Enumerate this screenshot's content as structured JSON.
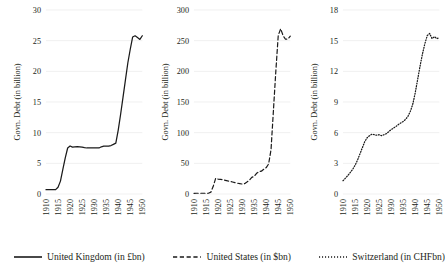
{
  "chart_data": {
    "type": "line",
    "title": "",
    "layout": "three side-by-side panels, shared x axis years 1910-1950",
    "grid": true,
    "legend_position": "bottom",
    "panels": [
      {
        "id": "united-kingdom",
        "series_name": "United Kingdom (in £bn)",
        "line_style": "solid",
        "ylabel": "Govn. Debt (in billion)",
        "xlabel": "",
        "ylim": [
          0,
          30
        ],
        "yticks": [
          0,
          5,
          10,
          15,
          20,
          25,
          30
        ],
        "ytick_labels": [
          "0",
          "5",
          "10",
          "15",
          "20",
          "25",
          "30"
        ],
        "xlim": [
          1910,
          1950
        ],
        "xticks": [
          1910,
          1915,
          1920,
          1925,
          1930,
          1935,
          1940,
          1945,
          1950
        ],
        "xtick_labels": [
          "1910",
          "1915",
          "1920",
          "1925",
          "1930",
          "1935",
          "1940",
          "1945",
          "1950"
        ],
        "x": [
          1910,
          1911,
          1912,
          1913,
          1914,
          1915,
          1916,
          1917,
          1918,
          1919,
          1920,
          1921,
          1922,
          1923,
          1924,
          1925,
          1926,
          1927,
          1928,
          1929,
          1930,
          1931,
          1932,
          1933,
          1934,
          1935,
          1936,
          1937,
          1938,
          1939,
          1940,
          1941,
          1942,
          1943,
          1944,
          1945,
          1946,
          1947,
          1948,
          1949,
          1950
        ],
        "values": [
          0.71,
          0.71,
          0.71,
          0.71,
          0.71,
          1.1,
          2.1,
          4.0,
          5.9,
          7.5,
          7.83,
          7.65,
          7.7,
          7.74,
          7.7,
          7.64,
          7.56,
          7.5,
          7.5,
          7.5,
          7.5,
          7.5,
          7.5,
          7.7,
          7.8,
          7.8,
          7.8,
          7.9,
          8.1,
          8.3,
          10.4,
          13.0,
          15.8,
          18.6,
          21.4,
          23.6,
          25.6,
          25.8,
          25.5,
          25.2,
          25.8
        ]
      },
      {
        "id": "united-states",
        "series_name": "United States (in $bn)",
        "line_style": "dashed",
        "ylabel": "Govn. Debt (in billion)",
        "xlabel": "",
        "ylim": [
          0,
          300
        ],
        "yticks": [
          0,
          50,
          100,
          150,
          200,
          250,
          300
        ],
        "ytick_labels": [
          "0",
          "50",
          "100",
          "150",
          "200",
          "250",
          "300"
        ],
        "xlim": [
          1910,
          1950
        ],
        "xticks": [
          1910,
          1915,
          1920,
          1925,
          1930,
          1935,
          1940,
          1945,
          1950
        ],
        "xtick_labels": [
          "1910",
          "1915",
          "1920",
          "1925",
          "1930",
          "1935",
          "1940",
          "1945",
          "1950"
        ],
        "x": [
          1910,
          1911,
          1912,
          1913,
          1914,
          1915,
          1916,
          1917,
          1918,
          1919,
          1920,
          1921,
          1922,
          1923,
          1924,
          1925,
          1926,
          1927,
          1928,
          1929,
          1930,
          1931,
          1932,
          1933,
          1934,
          1935,
          1936,
          1937,
          1938,
          1939,
          1940,
          1941,
          1942,
          1943,
          1944,
          1945,
          1946,
          1947,
          1948,
          1949,
          1950
        ],
        "values": [
          1.1,
          1.2,
          1.2,
          1.2,
          1.2,
          1.2,
          1.2,
          3.0,
          12.5,
          25.5,
          24.3,
          24.0,
          23.0,
          22.3,
          21.3,
          20.5,
          19.6,
          18.5,
          17.6,
          16.9,
          16.2,
          16.8,
          19.5,
          22.5,
          27.1,
          28.7,
          33.8,
          36.4,
          37.2,
          40.4,
          43.0,
          49.0,
          72.4,
          136.7,
          201.0,
          258.7,
          269.4,
          258.3,
          252.3,
          252.8,
          257.4
        ]
      },
      {
        "id": "switzerland",
        "series_name": "Switzerland (in CHFbn)",
        "line_style": "dotted",
        "ylabel": "Govn. Debt (in billion)",
        "xlabel": "",
        "ylim": [
          0,
          18
        ],
        "yticks": [
          0,
          3,
          6,
          9,
          12,
          15,
          18
        ],
        "ytick_labels": [
          "0",
          "3",
          "6",
          "9",
          "12",
          "15",
          "18"
        ],
        "xlim": [
          1910,
          1950
        ],
        "xticks": [
          1910,
          1915,
          1920,
          1925,
          1930,
          1935,
          1940,
          1945,
          1950
        ],
        "xtick_labels": [
          "1910",
          "1915",
          "1920",
          "1925",
          "1930",
          "1935",
          "1940",
          "1945",
          "1950"
        ],
        "x": [
          1910,
          1911,
          1912,
          1913,
          1914,
          1915,
          1916,
          1917,
          1918,
          1919,
          1920,
          1921,
          1922,
          1923,
          1924,
          1925,
          1926,
          1927,
          1928,
          1929,
          1930,
          1931,
          1932,
          1933,
          1934,
          1935,
          1936,
          1937,
          1938,
          1939,
          1940,
          1941,
          1942,
          1943,
          1944,
          1945,
          1946,
          1947,
          1948,
          1949,
          1950
        ],
        "values": [
          1.3,
          1.55,
          1.8,
          2.1,
          2.4,
          2.8,
          3.3,
          3.9,
          4.5,
          5.1,
          5.5,
          5.7,
          5.85,
          5.8,
          5.75,
          5.8,
          5.7,
          5.8,
          5.9,
          6.1,
          6.3,
          6.45,
          6.6,
          6.8,
          6.95,
          7.1,
          7.3,
          7.6,
          8.1,
          8.8,
          9.9,
          11.2,
          12.5,
          13.7,
          14.7,
          15.5,
          15.7,
          15.2,
          15.4,
          15.2,
          15.3
        ]
      }
    ]
  },
  "legend": {
    "entries": [
      {
        "label": "United Kingdom (in £bn)",
        "style": "solid"
      },
      {
        "label": "United States (in $bn)",
        "style": "dashed"
      },
      {
        "label": "Switzerland (in CHFbn)",
        "style": "dotted"
      }
    ]
  },
  "colors": {
    "line": "#1a1a1a",
    "grid": "#e9e9e9",
    "text": "#231f20",
    "background": "#ffffff"
  }
}
